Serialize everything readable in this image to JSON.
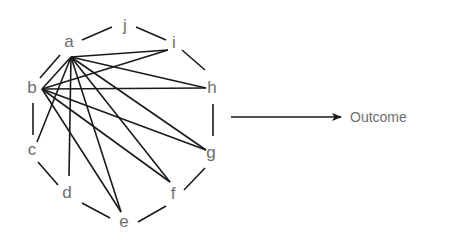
{
  "diagram": {
    "nodes": [
      {
        "id": "a",
        "label": "a",
        "x": 69,
        "y": 47,
        "hub": [
          71,
          57
        ]
      },
      {
        "id": "b",
        "label": "b",
        "x": 32,
        "y": 93,
        "hub": [
          42,
          89
        ]
      },
      {
        "id": "c",
        "label": "c",
        "x": 32,
        "y": 155,
        "hub": [
          37,
          142
        ]
      },
      {
        "id": "d",
        "label": "d",
        "x": 67,
        "y": 198,
        "hub": [
          69,
          176
        ]
      },
      {
        "id": "e",
        "label": "e",
        "x": 124,
        "y": 227,
        "hub": [
          121,
          212
        ]
      },
      {
        "id": "f",
        "label": "f",
        "x": 173,
        "y": 199,
        "hub": [
          170,
          182
        ]
      },
      {
        "id": "g",
        "label": "g",
        "x": 211,
        "y": 158,
        "hub": [
          206,
          150
        ]
      },
      {
        "id": "h",
        "label": "h",
        "x": 212,
        "y": 93,
        "hub": [
          206,
          88
        ]
      },
      {
        "id": "i",
        "label": "i",
        "x": 174,
        "y": 48,
        "hub": [
          168,
          50
        ]
      },
      {
        "id": "j",
        "label": "j",
        "x": 125,
        "y": 31,
        "hub": [
          125,
          27
        ]
      }
    ],
    "ring_edges": [
      {
        "x1": 82,
        "y1": 40,
        "x2": 112,
        "y2": 27
      },
      {
        "x1": 136,
        "y1": 27,
        "x2": 166,
        "y2": 40
      },
      {
        "x1": 182,
        "y1": 50,
        "x2": 205,
        "y2": 70
      },
      {
        "x1": 213,
        "y1": 104,
        "x2": 213,
        "y2": 136
      },
      {
        "x1": 205,
        "y1": 168,
        "x2": 184,
        "y2": 190
      },
      {
        "x1": 166,
        "y1": 206,
        "x2": 138,
        "y2": 222
      },
      {
        "x1": 110,
        "y1": 218,
        "x2": 82,
        "y2": 203
      },
      {
        "x1": 58,
        "y1": 185,
        "x2": 38,
        "y2": 162
      },
      {
        "x1": 33,
        "y1": 135,
        "x2": 33,
        "y2": 103
      },
      {
        "x1": 40,
        "y1": 78,
        "x2": 60,
        "y2": 55
      }
    ],
    "chords": [
      {
        "from": "a",
        "to": "b"
      },
      {
        "from": "a",
        "to": "c"
      },
      {
        "from": "a",
        "to": "d"
      },
      {
        "from": "a",
        "to": "e"
      },
      {
        "from": "a",
        "to": "f"
      },
      {
        "from": "a",
        "to": "g"
      },
      {
        "from": "a",
        "to": "h"
      },
      {
        "from": "a",
        "to": "i"
      },
      {
        "from": "b",
        "to": "i"
      },
      {
        "from": "b",
        "to": "h"
      },
      {
        "from": "b",
        "to": "g"
      },
      {
        "from": "b",
        "to": "f"
      },
      {
        "from": "b",
        "to": "e"
      }
    ],
    "arrow": {
      "x1": 231,
      "y1": 117,
      "x2": 341,
      "y2": 117
    },
    "outcome": {
      "label": "Outcome",
      "x": 350,
      "y": 122
    }
  }
}
